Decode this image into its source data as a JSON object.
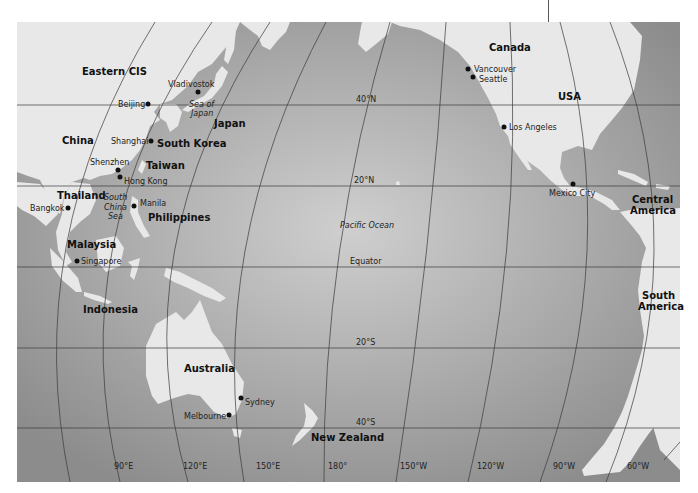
{
  "map": {
    "title": "Pacific Rim",
    "colors": {
      "land": "#e8e8e8",
      "ocean_center": "#cfcfcf",
      "ocean_edge": "#8c8c8c",
      "grid": "#3a3a3a",
      "text": "#111111"
    },
    "regions": [
      {
        "id": "eastern-cis",
        "label": "Eastern CIS"
      },
      {
        "id": "china",
        "label": "China"
      },
      {
        "id": "japan",
        "label": "Japan"
      },
      {
        "id": "south-korea",
        "label": "South Korea"
      },
      {
        "id": "taiwan",
        "label": "Taiwan"
      },
      {
        "id": "thailand",
        "label": "Thailand"
      },
      {
        "id": "philippines",
        "label": "Philippines"
      },
      {
        "id": "malaysia",
        "label": "Malaysia"
      },
      {
        "id": "indonesia",
        "label": "Indonesia"
      },
      {
        "id": "australia",
        "label": "Australia"
      },
      {
        "id": "new-zealand",
        "label": "New Zealand"
      },
      {
        "id": "canada",
        "label": "Canada"
      },
      {
        "id": "usa",
        "label": "USA"
      },
      {
        "id": "central-america-1",
        "label": "Central"
      },
      {
        "id": "central-america-2",
        "label": "America"
      },
      {
        "id": "south-america-1",
        "label": "South"
      },
      {
        "id": "south-america-2",
        "label": "America"
      }
    ],
    "seas": [
      {
        "id": "sea-of-japan-1",
        "label": "Sea of"
      },
      {
        "id": "sea-of-japan-2",
        "label": "Japan"
      },
      {
        "id": "south-china-sea-1",
        "label": "South"
      },
      {
        "id": "south-china-sea-2",
        "label": "China"
      },
      {
        "id": "south-china-sea-3",
        "label": "Sea"
      },
      {
        "id": "pacific-ocean",
        "label": "Pacific Ocean"
      }
    ],
    "cities": [
      {
        "id": "vladivostok",
        "label": "Vladivostok"
      },
      {
        "id": "beijing",
        "label": "Beijing"
      },
      {
        "id": "shanghai",
        "label": "Shanghai"
      },
      {
        "id": "shenzhen",
        "label": "Shenzhen"
      },
      {
        "id": "hong-kong",
        "label": "Hong Kong"
      },
      {
        "id": "bangkok",
        "label": "Bangkok"
      },
      {
        "id": "manila",
        "label": "Manila"
      },
      {
        "id": "singapore",
        "label": "Singapore"
      },
      {
        "id": "sydney",
        "label": "Sydney"
      },
      {
        "id": "melbourne",
        "label": "Melbourne"
      },
      {
        "id": "vancouver",
        "label": "Vancouver"
      },
      {
        "id": "seattle",
        "label": "Seattle"
      },
      {
        "id": "los-angeles",
        "label": "Los Angeles"
      },
      {
        "id": "mexico-city",
        "label": "Mexico City"
      }
    ],
    "parallels": [
      {
        "id": "40n",
        "label": "40°N"
      },
      {
        "id": "20n",
        "label": "20°N"
      },
      {
        "id": "equator",
        "label": "Equator"
      },
      {
        "id": "20s",
        "label": "20°S"
      },
      {
        "id": "40s",
        "label": "40°S"
      }
    ],
    "meridians": [
      {
        "id": "90e",
        "label": "90°E"
      },
      {
        "id": "120e",
        "label": "120°E"
      },
      {
        "id": "150e",
        "label": "150°E"
      },
      {
        "id": "180",
        "label": "180°"
      },
      {
        "id": "150w",
        "label": "150°W"
      },
      {
        "id": "120w",
        "label": "120°W"
      },
      {
        "id": "90w",
        "label": "90°W"
      },
      {
        "id": "60w",
        "label": "60°W"
      }
    ]
  }
}
